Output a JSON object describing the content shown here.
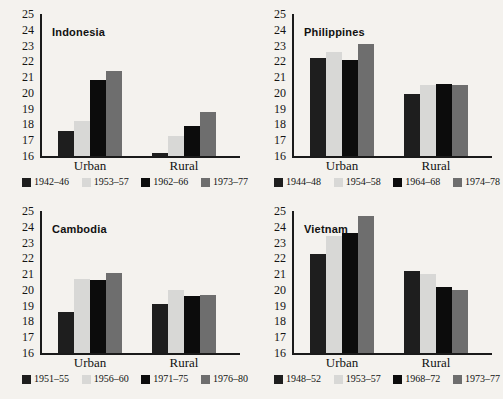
{
  "chart_data": [
    {
      "type": "bar",
      "title": "Indonesia",
      "categories": [
        "Urban",
        "Rural"
      ],
      "ylim": [
        16,
        25
      ],
      "yticks": [
        16,
        17,
        18,
        19,
        20,
        21,
        22,
        23,
        24,
        25
      ],
      "xlabel": "",
      "ylabel": "",
      "grid": false,
      "legend_position": "bottom",
      "series": [
        {
          "name": "1942–46",
          "color": "#1e1e1e",
          "values": [
            17.6,
            16.2
          ]
        },
        {
          "name": "1953–57",
          "color": "#d8d8d6",
          "values": [
            18.2,
            17.3
          ]
        },
        {
          "name": "1962–66",
          "color": "#0c0c0c",
          "values": [
            20.8,
            17.9
          ]
        },
        {
          "name": "1973–77",
          "color": "#6e6e6e",
          "values": [
            21.4,
            18.8
          ]
        }
      ]
    },
    {
      "type": "bar",
      "title": "Philippines",
      "categories": [
        "Urban",
        "Rural"
      ],
      "ylim": [
        16,
        25
      ],
      "yticks": [
        16,
        17,
        18,
        19,
        20,
        21,
        22,
        23,
        24,
        25
      ],
      "xlabel": "",
      "ylabel": "",
      "grid": false,
      "legend_position": "bottom",
      "series": [
        {
          "name": "1944–48",
          "color": "#1e1e1e",
          "values": [
            22.2,
            19.95
          ]
        },
        {
          "name": "1954–58",
          "color": "#d8d8d6",
          "values": [
            22.6,
            20.5
          ]
        },
        {
          "name": "1964–68",
          "color": "#0c0c0c",
          "values": [
            22.1,
            20.55
          ]
        },
        {
          "name": "1974–78",
          "color": "#6e6e6e",
          "values": [
            23.1,
            20.5
          ]
        }
      ]
    },
    {
      "type": "bar",
      "title": "Cambodia",
      "categories": [
        "Urban",
        "Rural"
      ],
      "ylim": [
        16,
        25
      ],
      "yticks": [
        16,
        17,
        18,
        19,
        20,
        21,
        22,
        23,
        24,
        25
      ],
      "xlabel": "",
      "ylabel": "",
      "grid": false,
      "legend_position": "bottom",
      "series": [
        {
          "name": "1951–55",
          "color": "#1e1e1e",
          "values": [
            18.6,
            19.1
          ]
        },
        {
          "name": "1956–60",
          "color": "#d8d8d6",
          "values": [
            20.7,
            20.0
          ]
        },
        {
          "name": "1971–75",
          "color": "#0c0c0c",
          "values": [
            20.6,
            19.6
          ]
        },
        {
          "name": "1976–80",
          "color": "#6e6e6e",
          "values": [
            21.1,
            19.7
          ]
        }
      ]
    },
    {
      "type": "bar",
      "title": "Vietnam",
      "categories": [
        "Urban",
        "Rural"
      ],
      "ylim": [
        16,
        25
      ],
      "yticks": [
        16,
        17,
        18,
        19,
        20,
        21,
        22,
        23,
        24,
        25
      ],
      "xlabel": "",
      "ylabel": "",
      "grid": false,
      "legend_position": "bottom",
      "series": [
        {
          "name": "1948–52",
          "color": "#1e1e1e",
          "values": [
            22.3,
            21.2
          ]
        },
        {
          "name": "1953–57",
          "color": "#d8d8d6",
          "values": [
            23.4,
            21.0
          ]
        },
        {
          "name": "1968–72",
          "color": "#0c0c0c",
          "values": [
            23.6,
            20.2
          ]
        },
        {
          "name": "1973–77",
          "color": "#6e6e6e",
          "values": [
            24.7,
            20.0
          ]
        }
      ]
    }
  ]
}
